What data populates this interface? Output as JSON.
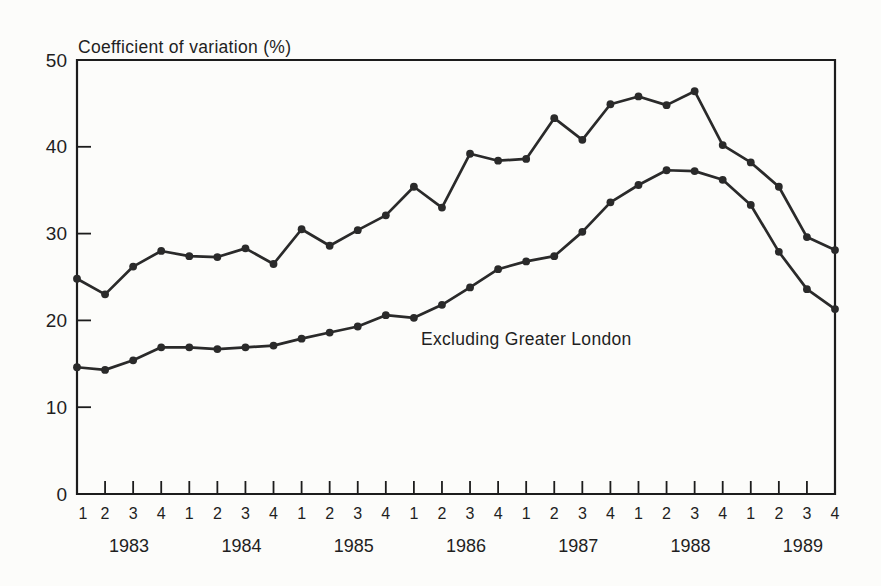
{
  "page_background": "#fcfcfa",
  "chart_data": {
    "type": "line",
    "title": "Coefficient of variation (%)",
    "xlabel": "",
    "ylabel": "Coefficient of variation (%)",
    "ylim": [
      0,
      50
    ],
    "y_ticks": [
      0,
      10,
      20,
      30,
      40,
      50
    ],
    "grid": false,
    "legend_position": "inline-annotation-on-lower-series",
    "line_color": "#2a2a2a",
    "frame_color": "#1c1c1c",
    "marker": "filled-circle",
    "quarter_labels": [
      "1",
      "2",
      "3",
      "4",
      "1",
      "2",
      "3",
      "4",
      "1",
      "2",
      "3",
      "4",
      "1",
      "2",
      "3",
      "4",
      "1",
      "2",
      "3",
      "4",
      "1",
      "2",
      "3",
      "4",
      "1",
      "2",
      "3",
      "4"
    ],
    "year_labels": [
      "1983",
      "1984",
      "1985",
      "1986",
      "1987",
      "1988",
      "1989"
    ],
    "series": [
      {
        "name": "",
        "note": "upper series (no visible label)",
        "values": [
          24.8,
          23.0,
          26.2,
          28.0,
          27.4,
          27.3,
          28.3,
          26.5,
          30.5,
          28.6,
          30.4,
          32.1,
          35.4,
          33.0,
          39.2,
          38.4,
          38.6,
          43.3,
          40.8,
          44.9,
          45.8,
          44.8,
          46.4,
          40.2,
          38.2,
          35.4,
          29.6,
          28.1
        ]
      },
      {
        "name": "Excluding Greater London",
        "note": "lower series, labeled inline",
        "values": [
          14.6,
          14.3,
          15.4,
          16.9,
          16.9,
          16.7,
          16.9,
          17.1,
          17.9,
          18.6,
          19.3,
          20.6,
          20.3,
          21.8,
          23.8,
          25.9,
          26.8,
          27.4,
          30.2,
          33.6,
          35.6,
          37.3,
          37.2,
          36.2,
          33.3,
          27.9,
          23.6,
          21.3
        ]
      }
    ],
    "annotation": {
      "text": "Excluding Greater London",
      "x": 421,
      "y": 345
    }
  }
}
